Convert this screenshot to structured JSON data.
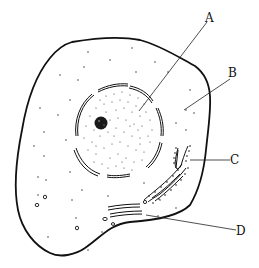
{
  "diagram": {
    "type": "animal-cell",
    "labels": [
      {
        "id": "A",
        "text": "A",
        "x": 210,
        "y": 20,
        "points_to": "nucleus"
      },
      {
        "id": "B",
        "text": "B",
        "x": 233,
        "y": 77,
        "points_to": "cytoplasm"
      },
      {
        "id": "C",
        "text": "C",
        "x": 233,
        "y": 164,
        "points_to": "rough-endoplasmic-reticulum"
      },
      {
        "id": "D",
        "text": "D",
        "x": 239,
        "y": 234,
        "points_to": "golgi-apparatus"
      }
    ],
    "colors": {
      "stroke": "#111111",
      "background": "#ffffff"
    }
  }
}
